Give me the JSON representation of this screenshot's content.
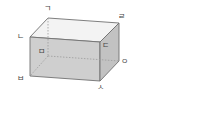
{
  "diagram": {
    "type": "rectangular-prism",
    "colors": {
      "top_face": "#f3f3f3",
      "front_face": "#cfcfcf",
      "side_face": "#c2c2c2",
      "edge": "#707070",
      "hidden_edge": "#9a9a9a"
    },
    "vertices": {
      "giyeok": {
        "label": "ㄱ",
        "position": "top-back-left"
      },
      "nieun": {
        "label": "ㄴ",
        "position": "top-front-left"
      },
      "digeut": {
        "label": "ㄷ",
        "position": "top-front-right"
      },
      "rieul": {
        "label": "ㄹ",
        "position": "top-back-right"
      },
      "mieum": {
        "label": "ㅁ",
        "position": "bottom-back-left (hidden)"
      },
      "bieup": {
        "label": "ㅂ",
        "position": "bottom-front-left"
      },
      "siot": {
        "label": "ㅅ",
        "position": "bottom-front-right"
      },
      "ieung": {
        "label": "ㅇ",
        "position": "bottom-back-right"
      }
    }
  }
}
